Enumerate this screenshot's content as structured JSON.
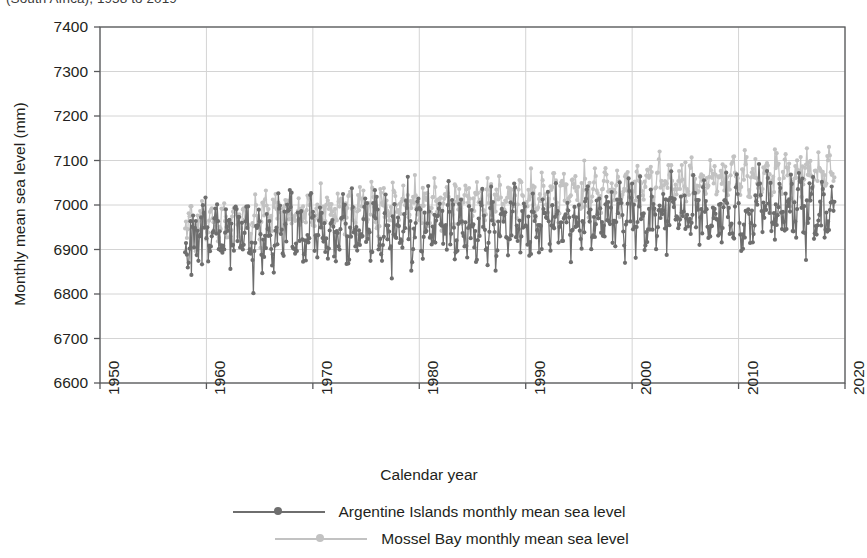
{
  "title_clipped": "(South Africa), 1958 to 2019",
  "colors": {
    "series_dark": "#6e6e6e",
    "series_light": "#c2c2c2",
    "axis": "#58595b",
    "grid": "#d4d4d4",
    "text": "#231f20",
    "background": "#ffffff"
  },
  "axis_titles": {
    "x": "Calendar year",
    "y": "Monthly mean sea level (mm)"
  },
  "legend": {
    "items": [
      {
        "label": "Argentine Islands monthly mean sea level",
        "color": "#6e6e6e"
      },
      {
        "label": "Mossel Bay monthly mean sea level",
        "color": "#c2c2c2"
      }
    ]
  },
  "chart_data": {
    "type": "line",
    "title": "(South Africa), 1958 to 2019",
    "xlabel": "Calendar year",
    "ylabel": "Monthly mean sea level (mm)",
    "xlim": [
      1950,
      2020
    ],
    "ylim": [
      6600,
      7400
    ],
    "xticks": [
      1950,
      1960,
      1970,
      1980,
      1990,
      2000,
      2010,
      2020
    ],
    "yticks": [
      6600,
      6700,
      6800,
      6900,
      7000,
      7100,
      7200,
      7300,
      7400
    ],
    "grid": true,
    "legend_position": "bottom",
    "markers": true,
    "series": [
      {
        "name": "Argentine Islands monthly mean sea level",
        "color": "#6e6e6e",
        "x_start": 1958.0,
        "x_end": 2019.0,
        "sampling": "monthly",
        "trend_start": 6925,
        "trend_end": 6990,
        "spread": 95,
        "values_note": "monthly means fluctuating roughly 6745-7180 mm, rising trend",
        "y_min": 6745,
        "y_max": 7180,
        "y_mean": 6952
      },
      {
        "name": "Mossel Bay monthly mean sea level",
        "color": "#c2c2c2",
        "x_start": 1958.0,
        "x_end": 2019.0,
        "sampling": "monthly",
        "trend_start": 6960,
        "trend_end": 7075,
        "spread": 60,
        "values_note": "monthly means fluctuating roughly 6775-7170 mm, rising trend",
        "y_min": 6775,
        "y_max": 7170,
        "y_mean": 7005
      }
    ]
  }
}
